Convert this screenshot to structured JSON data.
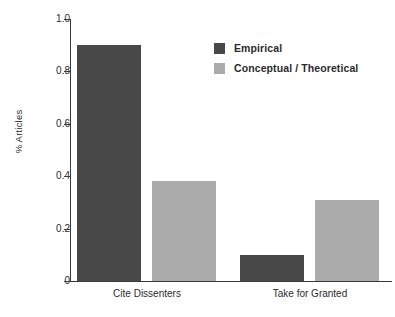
{
  "chart_data": {
    "type": "bar",
    "title": "",
    "xlabel": "",
    "ylabel": "% Articles",
    "ylim": [
      0,
      1.0
    ],
    "grid": false,
    "legend_position": "top-right",
    "categories": [
      "Cite Dissenters",
      "Take for Granted"
    ],
    "y_ticks": [
      "0",
      "0.2",
      "0.4",
      "0.6",
      "0.8",
      "1.0"
    ],
    "y_tick_values": [
      0,
      0.2,
      0.4,
      0.6,
      0.8,
      1.0
    ],
    "series": [
      {
        "name": "Empirical",
        "color": "#484848",
        "values": [
          0.9,
          0.1
        ]
      },
      {
        "name": "Conceptual / Theoretical",
        "color": "#ababab",
        "values": [
          0.38,
          0.31
        ]
      }
    ]
  },
  "axis": {
    "color": "#3a3a3a"
  }
}
